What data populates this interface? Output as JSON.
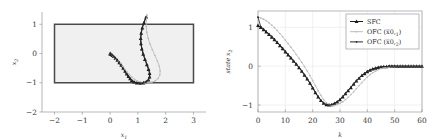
{
  "chart_data": [
    {
      "type": "line",
      "panel": "left",
      "title": "",
      "xlabel": "x1",
      "ylabel": "x2",
      "xlim": [
        -2.45,
        3.45
      ],
      "ylim": [
        -2.0,
        1.42
      ],
      "xticks": [
        -2,
        -1,
        0,
        1,
        2,
        3
      ],
      "xtick_labels": [
        "−2",
        "−1",
        "0",
        "1",
        "2",
        "3"
      ],
      "yticks": [
        1,
        0,
        -1,
        -2
      ],
      "ytick_labels": [
        "1",
        "0",
        "−1",
        "−2"
      ],
      "grid": false,
      "legend": "none",
      "annotations": [
        {
          "name": "constraint-box",
          "kind": "rectangle",
          "x_min": -2,
          "x_max": 3,
          "y_min": -1,
          "y_max": 1,
          "fill": "#f0f0f0",
          "stroke": "#4a4a4a"
        }
      ],
      "series": [
        {
          "name": "SFC",
          "color": "#1c1c1c",
          "marker": "triangle",
          "points": [
            [
              1.3,
              1.25
            ],
            [
              1.22,
              1.06
            ],
            [
              1.16,
              0.88
            ],
            [
              1.12,
              0.7
            ],
            [
              1.1,
              0.52
            ],
            [
              1.11,
              0.34
            ],
            [
              1.14,
              0.16
            ],
            [
              1.19,
              -0.02
            ],
            [
              1.25,
              -0.2
            ],
            [
              1.32,
              -0.38
            ],
            [
              1.38,
              -0.54
            ],
            [
              1.42,
              -0.68
            ],
            [
              1.42,
              -0.8
            ],
            [
              1.38,
              -0.9
            ],
            [
              1.3,
              -0.96
            ],
            [
              1.2,
              -1.0
            ],
            [
              1.08,
              -1.01
            ],
            [
              0.96,
              -1.0
            ],
            [
              0.86,
              -0.97
            ],
            [
              0.78,
              -0.92
            ],
            [
              0.72,
              -0.86
            ],
            [
              0.66,
              -0.78
            ],
            [
              0.6,
              -0.7
            ],
            [
              0.54,
              -0.6
            ],
            [
              0.47,
              -0.5
            ],
            [
              0.4,
              -0.4
            ],
            [
              0.33,
              -0.31
            ],
            [
              0.26,
              -0.23
            ],
            [
              0.19,
              -0.16
            ],
            [
              0.13,
              -0.1
            ],
            [
              0.08,
              -0.06
            ],
            [
              0.04,
              -0.03
            ],
            [
              0.01,
              -0.01
            ],
            [
              0.0,
              0.0
            ]
          ]
        },
        {
          "name": "OFC (x0,1)",
          "color": "#bdbdbd",
          "marker": "dot",
          "points": [
            [
              1.33,
              1.32
            ],
            [
              1.3,
              1.12
            ],
            [
              1.3,
              0.92
            ],
            [
              1.32,
              0.72
            ],
            [
              1.37,
              0.52
            ],
            [
              1.44,
              0.32
            ],
            [
              1.52,
              0.13
            ],
            [
              1.61,
              -0.06
            ],
            [
              1.7,
              -0.25
            ],
            [
              1.77,
              -0.43
            ],
            [
              1.8,
              -0.59
            ],
            [
              1.79,
              -0.73
            ],
            [
              1.73,
              -0.85
            ],
            [
              1.63,
              -0.93
            ],
            [
              1.5,
              -0.98
            ],
            [
              1.36,
              -1.0
            ],
            [
              1.22,
              -1.0
            ],
            [
              1.09,
              -0.98
            ],
            [
              0.98,
              -0.94
            ],
            [
              0.88,
              -0.88
            ],
            [
              0.79,
              -0.81
            ],
            [
              0.7,
              -0.72
            ],
            [
              0.61,
              -0.63
            ],
            [
              0.52,
              -0.53
            ],
            [
              0.44,
              -0.44
            ],
            [
              0.36,
              -0.35
            ],
            [
              0.28,
              -0.27
            ],
            [
              0.21,
              -0.2
            ],
            [
              0.15,
              -0.14
            ],
            [
              0.1,
              -0.09
            ],
            [
              0.06,
              -0.05
            ],
            [
              0.03,
              -0.02
            ],
            [
              0.01,
              -0.01
            ],
            [
              0.0,
              0.0
            ]
          ]
        },
        {
          "name": "OFC (x0,2)",
          "color": "#2a2a2a",
          "marker": "dot",
          "points": [
            [
              1.28,
              1.24
            ],
            [
              1.21,
              1.05
            ],
            [
              1.15,
              0.87
            ],
            [
              1.11,
              0.69
            ],
            [
              1.1,
              0.51
            ],
            [
              1.11,
              0.33
            ],
            [
              1.15,
              0.15
            ],
            [
              1.2,
              -0.03
            ],
            [
              1.27,
              -0.21
            ],
            [
              1.34,
              -0.39
            ],
            [
              1.4,
              -0.55
            ],
            [
              1.43,
              -0.69
            ],
            [
              1.42,
              -0.81
            ],
            [
              1.37,
              -0.91
            ],
            [
              1.29,
              -0.97
            ],
            [
              1.19,
              -1.0
            ],
            [
              1.07,
              -1.01
            ],
            [
              0.95,
              -1.0
            ],
            [
              0.85,
              -0.97
            ],
            [
              0.77,
              -0.92
            ],
            [
              0.7,
              -0.85
            ],
            [
              0.64,
              -0.77
            ],
            [
              0.58,
              -0.69
            ],
            [
              0.52,
              -0.59
            ],
            [
              0.45,
              -0.49
            ],
            [
              0.38,
              -0.4
            ],
            [
              0.31,
              -0.31
            ],
            [
              0.25,
              -0.23
            ],
            [
              0.18,
              -0.16
            ],
            [
              0.12,
              -0.1
            ],
            [
              0.07,
              -0.06
            ],
            [
              0.03,
              -0.03
            ],
            [
              0.01,
              -0.01
            ],
            [
              0.0,
              0.0
            ]
          ]
        }
      ]
    },
    {
      "type": "line",
      "panel": "right",
      "title": "",
      "xlabel": "k",
      "ylabel": "state x2",
      "xlim": [
        0,
        60
      ],
      "ylim": [
        -1.18,
        1.42
      ],
      "xticks": [
        0,
        10,
        20,
        30,
        40,
        50,
        60
      ],
      "xtick_labels": [
        "0",
        "10",
        "20",
        "30",
        "40",
        "50",
        "60"
      ],
      "yticks": [
        1,
        0,
        -1
      ],
      "ytick_labels": [
        "1",
        "0",
        "−1"
      ],
      "grid": true,
      "legend": "upper right",
      "x": [
        0,
        1,
        2,
        3,
        4,
        5,
        6,
        7,
        8,
        9,
        10,
        11,
        12,
        13,
        14,
        15,
        16,
        17,
        18,
        19,
        20,
        21,
        22,
        23,
        24,
        25,
        26,
        27,
        28,
        29,
        30,
        31,
        32,
        33,
        34,
        35,
        36,
        37,
        38,
        39,
        40,
        41,
        42,
        43,
        44,
        45,
        46,
        47,
        48,
        49,
        50,
        51,
        52,
        53,
        54,
        55,
        56,
        57,
        58,
        59,
        60
      ],
      "series": [
        {
          "name": "SFC",
          "color": "#1c1c1c",
          "marker": "triangle",
          "values": [
            1.05,
            1.0,
            0.94,
            0.88,
            0.82,
            0.75,
            0.68,
            0.61,
            0.53,
            0.45,
            0.37,
            0.29,
            0.21,
            0.13,
            0.05,
            -0.04,
            -0.13,
            -0.23,
            -0.33,
            -0.44,
            -0.56,
            -0.68,
            -0.79,
            -0.88,
            -0.95,
            -0.99,
            -1.0,
            -0.99,
            -0.96,
            -0.92,
            -0.86,
            -0.79,
            -0.71,
            -0.63,
            -0.55,
            -0.46,
            -0.38,
            -0.31,
            -0.24,
            -0.19,
            -0.14,
            -0.1,
            -0.07,
            -0.05,
            -0.03,
            -0.02,
            -0.01,
            -0.01,
            0.0,
            0.0,
            0.0,
            0.0,
            0.0,
            0.0,
            0.0,
            0.0,
            0.0,
            0.0,
            0.0,
            0.0,
            0.0
          ]
        },
        {
          "name": "OFC (x0,1)",
          "color": "#bdbdbd",
          "marker": "dot",
          "values": [
            1.27,
            1.24,
            1.21,
            1.17,
            1.12,
            1.06,
            0.99,
            0.92,
            0.84,
            0.76,
            0.67,
            0.58,
            0.49,
            0.4,
            0.3,
            0.2,
            0.1,
            -0.01,
            -0.12,
            -0.24,
            -0.37,
            -0.5,
            -0.63,
            -0.75,
            -0.86,
            -0.94,
            -0.99,
            -1.01,
            -1.01,
            -0.99,
            -0.96,
            -0.92,
            -0.86,
            -0.8,
            -0.73,
            -0.66,
            -0.58,
            -0.5,
            -0.42,
            -0.35,
            -0.28,
            -0.22,
            -0.17,
            -0.13,
            -0.09,
            -0.06,
            -0.04,
            -0.03,
            -0.02,
            -0.01,
            -0.01,
            0.0,
            0.0,
            0.0,
            0.0,
            0.0,
            0.0,
            0.0,
            0.0,
            0.0,
            0.0
          ]
        },
        {
          "name": "OFC (x0,2)",
          "color": "#2a2a2a",
          "marker": "dot",
          "values": [
            1.26,
            1.02,
            0.96,
            0.9,
            0.83,
            0.77,
            0.7,
            0.62,
            0.55,
            0.47,
            0.39,
            0.31,
            0.23,
            0.14,
            0.06,
            -0.03,
            -0.12,
            -0.22,
            -0.32,
            -0.43,
            -0.55,
            -0.67,
            -0.78,
            -0.88,
            -0.95,
            -0.99,
            -1.0,
            -0.99,
            -0.96,
            -0.91,
            -0.85,
            -0.78,
            -0.7,
            -0.62,
            -0.54,
            -0.45,
            -0.37,
            -0.3,
            -0.24,
            -0.18,
            -0.13,
            -0.1,
            -0.07,
            -0.05,
            -0.03,
            -0.02,
            -0.01,
            -0.01,
            0.0,
            0.0,
            0.0,
            0.0,
            0.0,
            0.0,
            0.0,
            0.0,
            0.0,
            0.0,
            0.0,
            0.0,
            0.0
          ]
        }
      ]
    }
  ],
  "left_panel": {
    "xlabel_base": "x",
    "xlabel_sub": "1",
    "ylabel_base": "x",
    "ylabel_sub": "2",
    "xtick_labels": [
      "−2",
      "−1",
      "0",
      "1",
      "2",
      "3"
    ],
    "ytick_labels": [
      "1",
      "0",
      "−1",
      "−2"
    ]
  },
  "right_panel": {
    "xlabel": "k",
    "ylabel_base": "state x",
    "ylabel_sub": "2",
    "xtick_labels": [
      "0",
      "10",
      "20",
      "30",
      "40",
      "50",
      "60"
    ],
    "ytick_labels": [
      "1",
      "0",
      "−1"
    ],
    "legend": {
      "items": [
        {
          "label": "SFC",
          "marker": "triangle",
          "color": "#1c1c1c"
        },
        {
          "label_base": "OFC (x̅0,",
          "label_sub": "1",
          "label_tail": ")",
          "marker": "dot",
          "color": "#bdbdbd"
        },
        {
          "label_base": "OFC (x̅0,",
          "label_sub": "2",
          "label_tail": ")",
          "marker": "dot",
          "color": "#2a2a2a"
        }
      ]
    }
  },
  "colors": {
    "sfc": "#1c1c1c",
    "ofc1": "#bdbdbd",
    "ofc2": "#2a2a2a",
    "box_fill": "#f0f0f0",
    "box_stroke": "#4a4a4a",
    "frame": "#9a9aa0",
    "grid": "#e8e8ec"
  }
}
